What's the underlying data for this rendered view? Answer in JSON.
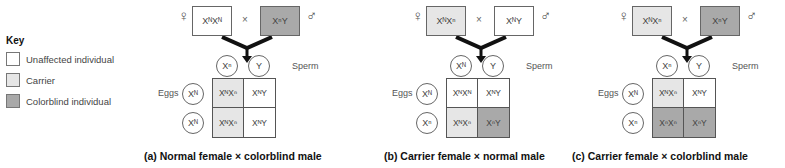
{
  "colors": {
    "unaffected": "#ffffff",
    "carrier": "#e6e6e6",
    "colorblind": "#a9a9a9"
  },
  "key": {
    "title": "Key",
    "items": [
      {
        "label": "Unaffected individual",
        "status": "unaffected"
      },
      {
        "label": "Carrier",
        "status": "carrier"
      },
      {
        "label": "Colorblind individual",
        "status": "colorblind"
      }
    ]
  },
  "labels": {
    "female_symbol": "♀",
    "male_symbol": "♂",
    "cross": "×",
    "sperm": "Sperm",
    "eggs": "Eggs"
  },
  "panels": [
    {
      "caption": "(a) Normal female × colorblind male",
      "female": {
        "genotype": "XᴺXᴺ",
        "status": "unaffected"
      },
      "male": {
        "genotype": "XⁿY",
        "status": "colorblind"
      },
      "sperm": [
        "Xⁿ",
        "Y"
      ],
      "eggs": [
        "Xᴺ",
        "Xᴺ"
      ],
      "offspring": [
        {
          "genotype": "XᴺXⁿ",
          "status": "carrier"
        },
        {
          "genotype": "XᴺY",
          "status": "unaffected"
        },
        {
          "genotype": "XᴺXⁿ",
          "status": "carrier"
        },
        {
          "genotype": "XᴺY",
          "status": "unaffected"
        }
      ]
    },
    {
      "caption": "(b) Carrier female × normal male",
      "female": {
        "genotype": "XᴺXⁿ",
        "status": "carrier"
      },
      "male": {
        "genotype": "XᴺY",
        "status": "unaffected"
      },
      "sperm": [
        "Xᴺ",
        "Y"
      ],
      "eggs": [
        "Xᴺ",
        "Xⁿ"
      ],
      "offspring": [
        {
          "genotype": "XᴺXᴺ",
          "status": "unaffected"
        },
        {
          "genotype": "XᴺY",
          "status": "unaffected"
        },
        {
          "genotype": "XᴺXⁿ",
          "status": "carrier"
        },
        {
          "genotype": "XⁿY",
          "status": "colorblind"
        }
      ]
    },
    {
      "caption": "(c) Carrier female × colorblind male",
      "female": {
        "genotype": "XᴺXⁿ",
        "status": "carrier"
      },
      "male": {
        "genotype": "XⁿY",
        "status": "colorblind"
      },
      "sperm": [
        "Xⁿ",
        "Y"
      ],
      "eggs": [
        "Xᴺ",
        "Xⁿ"
      ],
      "offspring": [
        {
          "genotype": "XᴺXⁿ",
          "status": "carrier"
        },
        {
          "genotype": "XᴺY",
          "status": "unaffected"
        },
        {
          "genotype": "XⁿXⁿ",
          "status": "colorblind"
        },
        {
          "genotype": "XⁿY",
          "status": "colorblind"
        }
      ]
    }
  ]
}
